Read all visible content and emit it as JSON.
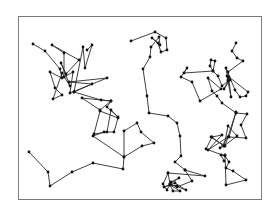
{
  "diagram": {
    "type": "random-walk-paths",
    "frame": {
      "x": 18.5,
      "y": 16.5,
      "width": 243,
      "height": 183
    },
    "colors": {
      "line": "#2a2a2a",
      "node": "#111111",
      "frame": "#7a7a7a",
      "background": "#ffffff"
    },
    "node_radius": 1.4,
    "paths": [
      {
        "name": "walk-left",
        "points": [
          [
            33,
            44
          ],
          [
            45,
            51
          ],
          [
            60,
            69
          ],
          [
            62,
            78
          ],
          [
            50,
            72
          ],
          [
            55,
            88
          ],
          [
            62,
            95
          ],
          [
            53,
            99
          ],
          [
            62,
            73
          ],
          [
            70,
            86
          ],
          [
            61,
            63
          ],
          [
            66,
            74
          ],
          [
            79,
            60
          ],
          [
            52,
            45
          ],
          [
            64,
            53
          ],
          [
            64,
            77
          ],
          [
            73,
            72
          ],
          [
            70,
            93
          ],
          [
            107,
            78
          ],
          [
            69,
            82
          ],
          [
            92,
            84
          ],
          [
            74,
            92
          ],
          [
            83,
            47
          ],
          [
            85,
            68
          ],
          [
            92,
            45
          ],
          [
            87,
            50
          ]
        ]
      },
      {
        "name": "walk-left-mid",
        "points": [
          [
            74,
            92
          ],
          [
            101,
            100
          ],
          [
            111,
            101
          ],
          [
            82,
            98
          ],
          [
            100,
            110
          ],
          [
            111,
            101
          ],
          [
            107,
            107
          ],
          [
            118,
            117
          ],
          [
            111,
            110
          ],
          [
            107,
            132
          ],
          [
            94,
            134
          ],
          [
            100,
            111
          ],
          [
            118,
            118
          ],
          [
            114,
            132
          ],
          [
            104,
            132
          ],
          [
            93,
            136
          ],
          [
            124,
            157
          ],
          [
            124,
            131
          ],
          [
            137,
            123
          ],
          [
            141,
            132
          ],
          [
            154,
            143
          ],
          [
            142,
            146
          ],
          [
            124,
            157
          ],
          [
            123,
            169
          ],
          [
            93,
            163
          ],
          [
            72,
            172
          ],
          [
            50,
            186
          ],
          [
            48,
            172
          ],
          [
            29,
            152
          ]
        ]
      },
      {
        "name": "walk-center",
        "points": [
          [
            131,
            41
          ],
          [
            155,
            32
          ],
          [
            166,
            38
          ],
          [
            167,
            50
          ],
          [
            161,
            52
          ],
          [
            158,
            43
          ],
          [
            152,
            38
          ],
          [
            160,
            45
          ],
          [
            159,
            37
          ],
          [
            151,
            47
          ],
          [
            150,
            57
          ],
          [
            143,
            69
          ],
          [
            147,
            96
          ],
          [
            149,
            113
          ],
          [
            168,
            116
          ],
          [
            177,
            123
          ],
          [
            180,
            136
          ],
          [
            181,
            156
          ],
          [
            175,
            162
          ],
          [
            185,
            170
          ],
          [
            205,
            176
          ],
          [
            168,
            173
          ],
          [
            170,
            184
          ],
          [
            177,
            187
          ],
          [
            192,
            181
          ],
          [
            185,
            170
          ]
        ]
      },
      {
        "name": "walk-center-bottom",
        "points": [
          [
            168,
            173
          ],
          [
            163,
            184
          ],
          [
            167,
            190
          ],
          [
            171,
            182
          ],
          [
            179,
            178
          ],
          [
            170,
            184
          ],
          [
            186,
            190
          ],
          [
            175,
            183
          ],
          [
            164,
            187
          ],
          [
            170,
            185
          ],
          [
            173,
            191
          ],
          [
            180,
            191
          ],
          [
            170,
            185
          ],
          [
            177,
            186
          ]
        ]
      },
      {
        "name": "walk-right-top",
        "points": [
          [
            236,
            43
          ],
          [
            232,
            51
          ],
          [
            237,
            58
          ],
          [
            243,
            61
          ],
          [
            228,
            72
          ],
          [
            231,
            97
          ],
          [
            227,
            76
          ],
          [
            228,
            80
          ],
          [
            226,
            68
          ],
          [
            235,
            90
          ],
          [
            240,
            97
          ],
          [
            246,
            96
          ],
          [
            248,
            92
          ],
          [
            229,
            77
          ],
          [
            230,
            80
          ],
          [
            224,
            89
          ],
          [
            228,
            81
          ],
          [
            222,
            86
          ],
          [
            218,
            76
          ],
          [
            213,
            71
          ],
          [
            215,
            61
          ],
          [
            211,
            60
          ],
          [
            210,
            66
          ],
          [
            213,
            71
          ],
          [
            184,
            73
          ],
          [
            187,
            68
          ],
          [
            181,
            77
          ],
          [
            192,
            82
          ],
          [
            200,
            101
          ],
          [
            221,
            89
          ],
          [
            208,
            78
          ],
          [
            212,
            91
          ],
          [
            217,
            96
          ],
          [
            222,
            103
          ],
          [
            236,
            113
          ]
        ]
      },
      {
        "name": "walk-right-bottom",
        "points": [
          [
            236,
            113
          ],
          [
            247,
            114
          ],
          [
            241,
            125
          ],
          [
            246,
            138
          ],
          [
            229,
            137
          ],
          [
            236,
            112
          ],
          [
            225,
            146
          ],
          [
            211,
            137
          ],
          [
            224,
            146
          ],
          [
            237,
            136
          ],
          [
            228,
            126
          ],
          [
            224,
            146
          ],
          [
            220,
            148
          ],
          [
            228,
            137
          ],
          [
            208,
            150
          ],
          [
            222,
            135
          ],
          [
            212,
            137
          ],
          [
            206,
            149
          ],
          [
            225,
            156
          ],
          [
            229,
            162
          ],
          [
            226,
            168
          ],
          [
            233,
            171
          ],
          [
            246,
            180
          ],
          [
            226,
            185
          ],
          [
            225,
            155
          ],
          [
            221,
            155
          ],
          [
            224,
            161
          ]
        ]
      }
    ]
  }
}
